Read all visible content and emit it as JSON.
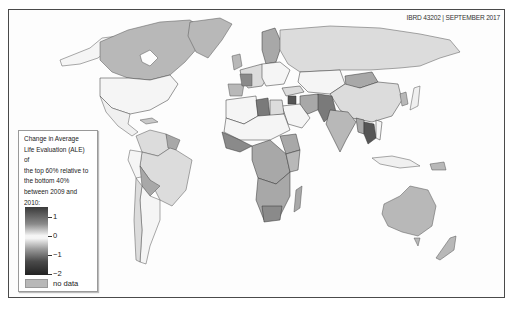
{
  "map": {
    "credit": "IBRD 43202 | SEPTEMBER 2017",
    "colors": {
      "background": "#fdfdfd",
      "frame": "#4a4a4a",
      "no_data": "#b8b8b8",
      "light_positive": "#dcdcdc",
      "neutral": "#f5f5f5",
      "mid_gray": "#a8a8a8",
      "dark_gray": "#7a7a7a",
      "darkest": "#555555",
      "border": "#333333"
    }
  },
  "legend": {
    "title": "Change in Average\nLife Evaluation (ALE) of\nthe top 60% relative to\nthe bottom 40%\nbetween 2009 and 2010:",
    "scale": {
      "ticks": [
        {
          "label": "1",
          "value": 1
        },
        {
          "label": "0",
          "value": 0
        },
        {
          "label": "−1",
          "value": -1
        },
        {
          "label": "−2",
          "value": -2
        }
      ]
    },
    "no_data_label": "no data"
  }
}
